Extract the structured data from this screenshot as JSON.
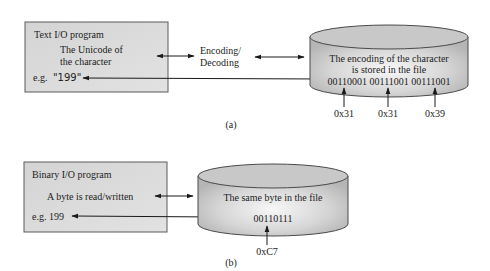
{
  "panel_a": {
    "program_box": {
      "title": "Text I/O program",
      "line1": "The Unicode of",
      "line2": "the character",
      "example_prefix": "e.g.",
      "example_value": "\"199\""
    },
    "middle_label_line1": "Encoding/",
    "middle_label_line2": "Decoding",
    "file": {
      "line1": "The encoding of the character",
      "line2": "is stored in the file",
      "bits": "00110001 00111001 00111001",
      "hex": [
        "0x31",
        "0x31",
        "0x39"
      ]
    },
    "caption": "(a)"
  },
  "panel_b": {
    "program_box": {
      "title": "Binary I/O program",
      "line1": "A byte is read/written",
      "example": "e.g. 199"
    },
    "file": {
      "line1": "The same byte in the file",
      "bits": "00110111",
      "hex": "0xC7"
    },
    "caption": "(b)"
  },
  "colors": {
    "box_fill": "#d9d9d9",
    "box_stroke": "#555555",
    "cylinder_top": "#c4c4c4",
    "cylinder_side_light": "#f2f2f2",
    "cylinder_side_dark": "#b8b8b8",
    "arrow": "#1a1a1a"
  }
}
